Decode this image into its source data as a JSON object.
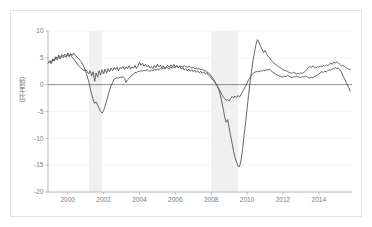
{
  "figure": {
    "background_color": "#ffffff",
    "border_color": "#e3e3e3",
    "axis_color": "#9a9a9a",
    "line_color": "#4a4a4a",
    "zero_line_color": "#808080",
    "grid_color": "#f2f2f2",
    "shade_color": "#f0f0f0",
    "tick_text_color": "#7a7a7a"
  },
  "chart_data": {
    "type": "line",
    "title": "",
    "xlabel": "",
    "ylabel": "（前年比）",
    "xlim": [
      1998.9,
      2015.85
    ],
    "ylim": [
      -20,
      10
    ],
    "yticks": [
      10,
      5,
      0,
      -5,
      -10,
      -15,
      -20
    ],
    "ytick_labels": [
      "10",
      "5",
      "0",
      "-5",
      "-10",
      "-15",
      "-20"
    ],
    "xticks": [
      2000,
      2002,
      2004,
      2006,
      2008,
      2010,
      2012,
      2014
    ],
    "xtick_labels": [
      "2000",
      "2002",
      "2004",
      "2006",
      "2008",
      "2010",
      "2012",
      "2014"
    ],
    "grid": true,
    "legend": "none",
    "zero_line": 0,
    "shaded_regions": [
      {
        "name": "recession-band-2001",
        "x0": 2001.2,
        "x1": 2001.92
      },
      {
        "name": "recession-band-2008",
        "x0": 2008.0,
        "x1": 2009.5
      }
    ],
    "series": [
      {
        "name": "series-a",
        "color": "#4a4a4a",
        "x": [
          1998.92,
          1999.0,
          1999.08,
          1999.17,
          1999.25,
          1999.33,
          1999.42,
          1999.5,
          1999.58,
          1999.67,
          1999.75,
          1999.83,
          1999.92,
          2000.0,
          2000.08,
          2000.17,
          2000.25,
          2000.33,
          2000.42,
          2000.5,
          2000.58,
          2000.67,
          2000.75,
          2000.83,
          2000.92,
          2001.0,
          2001.08,
          2001.17,
          2001.25,
          2001.33,
          2001.42,
          2001.5,
          2001.58,
          2001.67,
          2001.75,
          2001.83,
          2001.92,
          2002.0,
          2002.08,
          2002.17,
          2002.25,
          2002.33,
          2002.42,
          2002.5,
          2002.58,
          2002.67,
          2002.75,
          2002.83,
          2002.92,
          2003.0,
          2003.08,
          2003.17,
          2003.25,
          2003.33,
          2003.42,
          2003.5,
          2003.58,
          2003.67,
          2003.75,
          2003.83,
          2003.92,
          2004.0,
          2004.08,
          2004.17,
          2004.25,
          2004.33,
          2004.42,
          2004.5,
          2004.58,
          2004.67,
          2004.75,
          2004.83,
          2004.92,
          2005.0,
          2005.08,
          2005.17,
          2005.25,
          2005.33,
          2005.42,
          2005.5,
          2005.58,
          2005.67,
          2005.75,
          2005.83,
          2005.92,
          2006.0,
          2006.08,
          2006.17,
          2006.25,
          2006.33,
          2006.42,
          2006.5,
          2006.58,
          2006.67,
          2006.75,
          2006.83,
          2006.92,
          2007.0,
          2007.08,
          2007.17,
          2007.25,
          2007.33,
          2007.42,
          2007.5,
          2007.58,
          2007.67,
          2007.75,
          2007.83,
          2007.92,
          2008.0,
          2008.08,
          2008.17,
          2008.25,
          2008.33,
          2008.42,
          2008.5,
          2008.58,
          2008.67,
          2008.75,
          2008.83,
          2008.92,
          2009.0,
          2009.08,
          2009.17,
          2009.25,
          2009.33,
          2009.42,
          2009.5,
          2009.58,
          2009.67,
          2009.75,
          2009.83,
          2009.92,
          2010.0,
          2010.08,
          2010.17,
          2010.25,
          2010.33,
          2010.42,
          2010.5,
          2010.58,
          2010.67,
          2010.75,
          2010.83,
          2010.92,
          2011.0,
          2011.08,
          2011.17,
          2011.25,
          2011.33,
          2011.42,
          2011.5,
          2011.58,
          2011.67,
          2011.75,
          2011.83,
          2011.92,
          2012.0,
          2012.08,
          2012.17,
          2012.25,
          2012.33,
          2012.42,
          2012.5,
          2012.58,
          2012.67,
          2012.75,
          2012.83,
          2012.92,
          2013.0,
          2013.08,
          2013.17,
          2013.25,
          2013.33,
          2013.42,
          2013.5,
          2013.58,
          2013.67,
          2013.75,
          2013.83,
          2013.92,
          2014.0,
          2014.08,
          2014.17,
          2014.25,
          2014.33,
          2014.42,
          2014.5,
          2014.58,
          2014.67,
          2014.75,
          2014.83,
          2014.92,
          2015.0,
          2015.08,
          2015.17,
          2015.25,
          2015.33,
          2015.42,
          2015.5,
          2015.58,
          2015.67,
          2015.75
        ],
        "y": [
          4.0,
          4.3,
          3.9,
          4.6,
          4.4,
          5.0,
          4.6,
          5.2,
          4.8,
          5.3,
          5.0,
          5.4,
          5.1,
          5.6,
          5.2,
          5.8,
          5.5,
          5.9,
          5.5,
          5.2,
          5.0,
          4.6,
          4.3,
          3.8,
          3.2,
          2.5,
          1.6,
          0.6,
          -0.6,
          -1.8,
          -2.8,
          -3.5,
          -3.2,
          -3.8,
          -4.4,
          -5.0,
          -5.3,
          -4.8,
          -4.0,
          -3.0,
          -2.0,
          -1.0,
          -0.2,
          0.4,
          1.0,
          1.2,
          1.3,
          1.2,
          1.4,
          1.3,
          1.5,
          1.2,
          0.4,
          0.9,
          1.2,
          1.5,
          1.7,
          2.0,
          2.3,
          2.2,
          2.5,
          2.4,
          2.6,
          2.5,
          2.7,
          2.6,
          2.8,
          2.6,
          2.5,
          2.7,
          2.6,
          2.8,
          2.7,
          2.9,
          2.8,
          3.0,
          2.9,
          3.1,
          3.0,
          3.2,
          3.1,
          3.0,
          3.2,
          3.1,
          3.3,
          3.2,
          3.4,
          3.3,
          3.5,
          3.4,
          3.3,
          3.5,
          3.4,
          3.2,
          3.4,
          3.3,
          3.1,
          3.2,
          3.0,
          3.1,
          2.9,
          3.0,
          2.8,
          2.9,
          2.7,
          2.6,
          2.4,
          2.2,
          2.0,
          1.6,
          1.2,
          0.8,
          0.3,
          -0.2,
          -0.9,
          -1.8,
          -3.0,
          -4.5,
          -6.0,
          -7.0,
          -6.5,
          -8.0,
          -9.5,
          -11.0,
          -12.5,
          -13.6,
          -14.5,
          -15.2,
          -15.3,
          -14.0,
          -12.0,
          -9.5,
          -7.0,
          -4.5,
          -2.0,
          0.5,
          2.5,
          4.5,
          6.2,
          7.5,
          8.4,
          7.8,
          7.2,
          6.6,
          6.0,
          6.4,
          5.8,
          5.3,
          5.0,
          4.6,
          4.3,
          4.0,
          3.8,
          3.6,
          3.4,
          3.2,
          3.0,
          2.8,
          2.7,
          2.6,
          2.5,
          2.3,
          2.2,
          2.1,
          2.3,
          2.2,
          2.0,
          2.1,
          2.0,
          2.2,
          2.1,
          2.3,
          2.5,
          2.8,
          3.2,
          3.4,
          3.2,
          3.5,
          3.3,
          3.1,
          3.4,
          3.2,
          3.5,
          3.3,
          3.6,
          3.4,
          3.7,
          3.5,
          3.8,
          4.0,
          3.8,
          4.2,
          4.0,
          4.3,
          4.1,
          3.8,
          3.5,
          3.6,
          3.4,
          3.2,
          3.0,
          2.9,
          2.8
        ]
      },
      {
        "name": "series-b",
        "color": "#4a4a4a",
        "x": [
          1998.92,
          1999.0,
          1999.08,
          1999.17,
          1999.25,
          1999.33,
          1999.42,
          1999.5,
          1999.58,
          1999.67,
          1999.75,
          1999.83,
          1999.92,
          2000.0,
          2000.08,
          2000.17,
          2000.25,
          2000.33,
          2000.42,
          2000.5,
          2000.58,
          2000.67,
          2000.75,
          2000.83,
          2000.92,
          2001.0,
          2001.08,
          2001.17,
          2001.25,
          2001.33,
          2001.42,
          2001.5,
          2001.58,
          2001.67,
          2001.75,
          2001.83,
          2001.92,
          2002.0,
          2002.08,
          2002.17,
          2002.25,
          2002.33,
          2002.42,
          2002.5,
          2002.58,
          2002.67,
          2002.75,
          2002.83,
          2002.92,
          2003.0,
          2003.08,
          2003.17,
          2003.25,
          2003.33,
          2003.42,
          2003.5,
          2003.58,
          2003.67,
          2003.75,
          2003.83,
          2003.92,
          2004.0,
          2004.08,
          2004.17,
          2004.25,
          2004.33,
          2004.42,
          2004.5,
          2004.58,
          2004.67,
          2004.75,
          2004.83,
          2004.92,
          2005.0,
          2005.08,
          2005.17,
          2005.25,
          2005.33,
          2005.42,
          2005.5,
          2005.58,
          2005.67,
          2005.75,
          2005.83,
          2005.92,
          2006.0,
          2006.08,
          2006.17,
          2006.25,
          2006.33,
          2006.42,
          2006.5,
          2006.58,
          2006.67,
          2006.75,
          2006.83,
          2006.92,
          2007.0,
          2007.08,
          2007.17,
          2007.25,
          2007.33,
          2007.42,
          2007.5,
          2007.58,
          2007.67,
          2007.75,
          2007.83,
          2007.92,
          2008.0,
          2008.08,
          2008.17,
          2008.25,
          2008.33,
          2008.42,
          2008.5,
          2008.58,
          2008.67,
          2008.75,
          2008.83,
          2008.92,
          2009.0,
          2009.08,
          2009.17,
          2009.25,
          2009.33,
          2009.42,
          2009.5,
          2009.58,
          2009.67,
          2009.75,
          2009.83,
          2009.92,
          2010.0,
          2010.08,
          2010.17,
          2010.25,
          2010.33,
          2010.42,
          2010.5,
          2010.58,
          2010.67,
          2010.75,
          2010.83,
          2010.92,
          2011.0,
          2011.08,
          2011.17,
          2011.25,
          2011.33,
          2011.42,
          2011.5,
          2011.58,
          2011.67,
          2011.75,
          2011.83,
          2011.92,
          2012.0,
          2012.08,
          2012.17,
          2012.25,
          2012.33,
          2012.42,
          2012.5,
          2012.58,
          2012.67,
          2012.75,
          2012.83,
          2012.92,
          2013.0,
          2013.08,
          2013.17,
          2013.25,
          2013.33,
          2013.42,
          2013.5,
          2013.58,
          2013.67,
          2013.75,
          2013.83,
          2013.92,
          2014.0,
          2014.08,
          2014.17,
          2014.25,
          2014.33,
          2014.42,
          2014.5,
          2014.58,
          2014.67,
          2014.75,
          2014.83,
          2014.92,
          2015.0,
          2015.08,
          2015.17,
          2015.25,
          2015.33,
          2015.42,
          2015.5,
          2015.58,
          2015.67,
          2015.75
        ],
        "y": [
          4.2,
          4.5,
          4.2,
          4.8,
          4.5,
          5.2,
          4.9,
          5.5,
          5.1,
          5.6,
          5.3,
          5.7,
          5.4,
          5.9,
          5.4,
          5.6,
          5.1,
          4.8,
          4.4,
          4.0,
          3.6,
          3.3,
          3.0,
          2.8,
          2.6,
          2.8,
          2.4,
          2.0,
          2.6,
          1.6,
          2.4,
          0.6,
          2.2,
          1.4,
          2.6,
          1.8,
          2.8,
          2.0,
          2.9,
          2.2,
          3.0,
          2.4,
          3.1,
          2.6,
          3.2,
          2.8,
          3.3,
          2.6,
          3.2,
          3.0,
          3.4,
          2.8,
          3.3,
          3.0,
          3.5,
          2.9,
          3.3,
          3.1,
          3.6,
          3.0,
          3.5,
          4.2,
          3.6,
          4.0,
          3.4,
          3.8,
          3.3,
          3.6,
          3.1,
          3.4,
          3.0,
          3.6,
          3.2,
          3.8,
          3.3,
          3.6,
          3.1,
          3.5,
          3.0,
          3.4,
          3.6,
          3.2,
          3.7,
          3.3,
          3.8,
          3.3,
          3.6,
          3.1,
          3.4,
          2.9,
          3.2,
          2.7,
          3.0,
          2.6,
          2.9,
          2.5,
          2.8,
          2.4,
          2.7,
          2.3,
          2.6,
          2.2,
          2.5,
          2.1,
          2.4,
          2.0,
          2.2,
          1.8,
          1.6,
          1.2,
          0.9,
          0.6,
          0.2,
          -0.2,
          -0.7,
          -1.2,
          -1.8,
          -2.3,
          -2.6,
          -2.9,
          -2.8,
          -3.0,
          -2.6,
          -2.2,
          -2.5,
          -2.1,
          -2.4,
          -2.0,
          -2.3,
          -1.8,
          -1.3,
          -0.8,
          -0.3,
          0.3,
          0.9,
          1.4,
          1.8,
          2.1,
          2.3,
          2.4,
          2.5,
          2.4,
          2.6,
          2.5,
          2.7,
          2.6,
          2.8,
          2.7,
          2.9,
          2.6,
          2.4,
          2.2,
          2.0,
          1.8,
          1.7,
          1.6,
          1.5,
          1.4,
          1.6,
          1.5,
          1.7,
          1.6,
          1.4,
          1.3,
          1.5,
          1.4,
          1.6,
          1.5,
          1.4,
          1.3,
          1.5,
          1.4,
          1.6,
          1.5,
          1.3,
          1.2,
          1.4,
          1.3,
          1.5,
          1.6,
          1.8,
          2.0,
          2.2,
          2.4,
          2.3,
          2.5,
          2.4,
          2.6,
          2.8,
          2.7,
          2.9,
          3.0,
          3.2,
          3.0,
          3.1,
          2.8,
          2.4,
          1.8,
          1.2,
          0.6,
          0.0,
          -0.6,
          -1.2
        ]
      }
    ]
  }
}
